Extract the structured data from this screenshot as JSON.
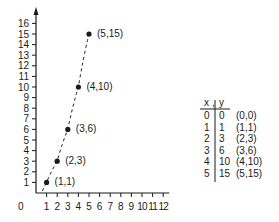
{
  "chart_data": {
    "type": "scatter",
    "title": "",
    "xlabel": "",
    "ylabel": "",
    "xlim": [
      0,
      12
    ],
    "ylim": [
      0,
      16
    ],
    "x_ticks": [
      "1",
      "2",
      "3",
      "4",
      "5",
      "6",
      "7",
      "8",
      "9",
      "10",
      "11",
      "12"
    ],
    "y_ticks": [
      "1",
      "2",
      "3",
      "4",
      "5",
      "6",
      "7",
      "8",
      "9",
      "10",
      "11",
      "12",
      "13",
      "14",
      "15",
      "16"
    ],
    "origin_label": "0",
    "grid": false,
    "series": [
      {
        "name": "points",
        "x": [
          1,
          2,
          3,
          4,
          5
        ],
        "y": [
          1,
          3,
          6,
          10,
          15
        ],
        "marker": "dot",
        "line": "dashed",
        "labels": [
          "(1,1)",
          "(2,3)",
          "(3,6)",
          "(4,10)",
          "(5,15)"
        ]
      }
    ],
    "table": {
      "headers": [
        "x",
        "y"
      ],
      "rows": [
        {
          "x": "0",
          "y": "0",
          "pair": "(0,0)"
        },
        {
          "x": "1",
          "y": "1",
          "pair": "(1,1)"
        },
        {
          "x": "2",
          "y": "3",
          "pair": "(2,3)"
        },
        {
          "x": "3",
          "y": "6",
          "pair": "(3,6)"
        },
        {
          "x": "4",
          "y": "10",
          "pair": "(4,10)"
        },
        {
          "x": "5",
          "y": "15",
          "pair": "(5,15)"
        }
      ]
    }
  }
}
